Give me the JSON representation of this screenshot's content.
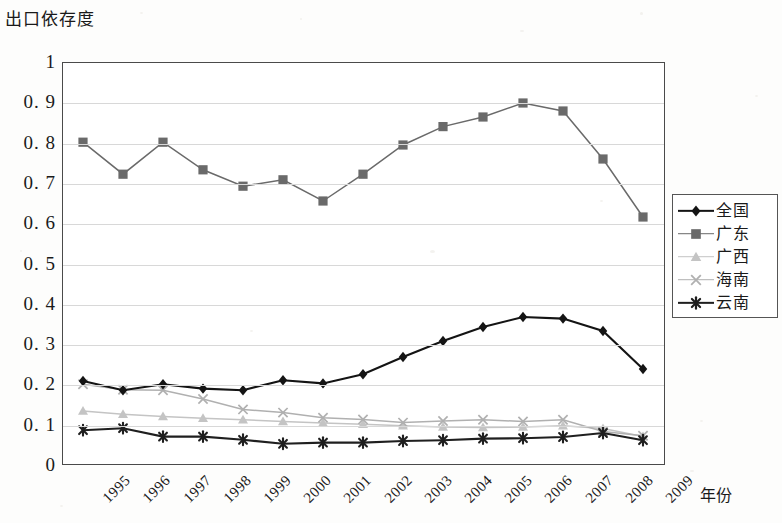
{
  "chart_data": {
    "type": "line",
    "title": "出口依存度",
    "xlabel": "年份",
    "ylabel": "出口依存度",
    "categories": [
      "1995",
      "1996",
      "1997",
      "1998",
      "1999",
      "2000",
      "2001",
      "2002",
      "2003",
      "2004",
      "2005",
      "2006",
      "2007",
      "2008",
      "2009"
    ],
    "ylim": [
      0,
      1
    ],
    "yticks": [
      "0",
      "0. 1",
      "0. 2",
      "0. 3",
      "0. 4",
      "0. 5",
      "0. 6",
      "0. 7",
      "0. 8",
      "0. 9",
      "1"
    ],
    "ytick_values": [
      0,
      0.1,
      0.2,
      0.3,
      0.4,
      0.5,
      0.6,
      0.7,
      0.8,
      0.9,
      1
    ],
    "grid": true,
    "legend_position": "right",
    "series": [
      {
        "name": "全国",
        "marker": "diamond",
        "color": "#141414",
        "values": [
          0.205,
          0.182,
          0.197,
          0.186,
          0.182,
          0.207,
          0.199,
          0.222,
          0.265,
          0.305,
          0.34,
          0.365,
          0.361,
          0.33,
          0.235
        ]
      },
      {
        "name": "广东",
        "marker": "square",
        "color": "#6a6a6a",
        "values": [
          0.802,
          0.722,
          0.802,
          0.733,
          0.692,
          0.708,
          0.655,
          0.722,
          0.795,
          0.841,
          0.865,
          0.9,
          0.88,
          0.76,
          0.615
        ]
      },
      {
        "name": "广西",
        "marker": "triangle",
        "color": "#c4c4c4",
        "values": [
          0.13,
          0.122,
          0.116,
          0.112,
          0.108,
          0.104,
          0.1,
          0.097,
          0.093,
          0.09,
          0.089,
          0.09,
          0.093,
          0.086,
          0.066
        ]
      },
      {
        "name": "海南",
        "marker": "cross",
        "color": "#b0b0b0",
        "values": [
          0.197,
          0.183,
          0.182,
          0.16,
          0.134,
          0.126,
          0.113,
          0.109,
          0.101,
          0.105,
          0.108,
          0.104,
          0.108,
          0.079,
          0.068
        ]
      },
      {
        "name": "云南",
        "marker": "asterisk",
        "color": "#1f1f1f",
        "values": [
          0.082,
          0.087,
          0.066,
          0.066,
          0.058,
          0.048,
          0.051,
          0.051,
          0.055,
          0.057,
          0.061,
          0.062,
          0.065,
          0.075,
          0.057
        ]
      }
    ]
  },
  "legend": {
    "items": [
      {
        "label": "全国"
      },
      {
        "label": "广东"
      },
      {
        "label": "广西"
      },
      {
        "label": "海南"
      },
      {
        "label": "云南"
      }
    ]
  }
}
